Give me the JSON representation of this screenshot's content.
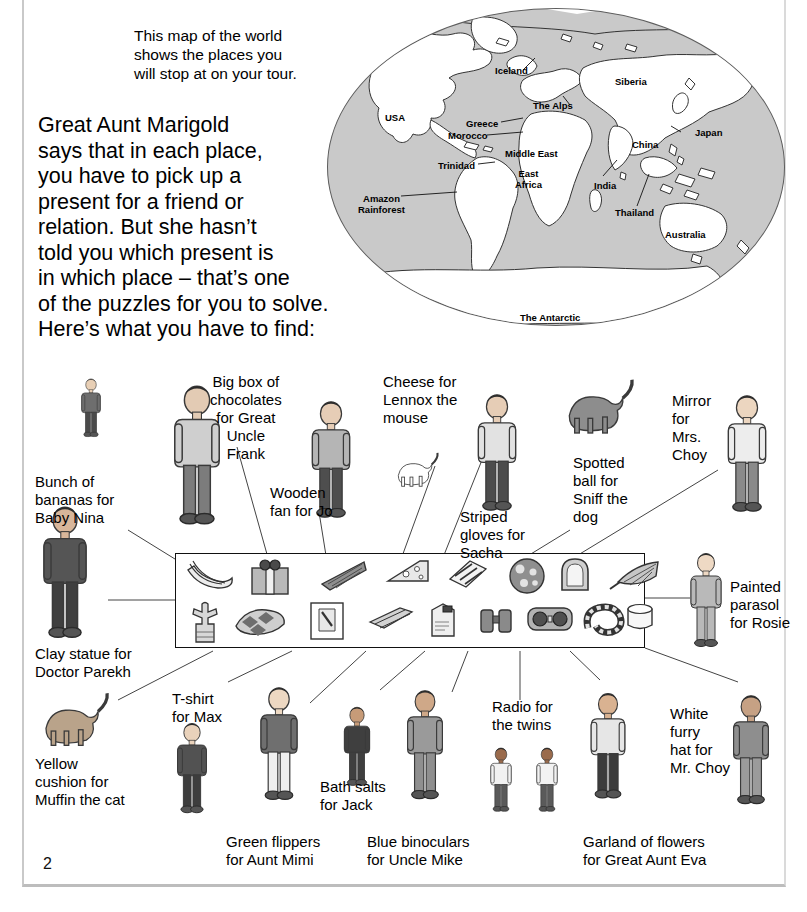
{
  "page": {
    "number": "2",
    "background": "#ffffff",
    "frame_color": "#c9c9c9"
  },
  "intro": {
    "map_caption": "This map of the world\nshows the places you\nwill stop at on your tour.",
    "body": "Great Aunt Marigold\nsays that in each place,\nyou have to pick up a\npresent for a friend or\nrelation. But she hasn’t\ntold you which present is\nin which place – that’s one\nof the puzzles for you to solve.\nHere’s what you have to find:"
  },
  "map": {
    "ocean_color": "#c9c9c9",
    "land_outline": "#333333",
    "labels": [
      {
        "name": "USA",
        "text": "USA",
        "x": 58,
        "y": 104
      },
      {
        "name": "Iceland",
        "text": "Iceland",
        "x": 168,
        "y": 57
      },
      {
        "name": "Siberia",
        "text": "Siberia",
        "x": 288,
        "y": 68
      },
      {
        "name": "The Alps",
        "text": "The Alps",
        "x": 206,
        "y": 92
      },
      {
        "name": "Greece",
        "text": "Greece",
        "x": 139,
        "y": 110
      },
      {
        "name": "Japan",
        "text": "Japan",
        "x": 368,
        "y": 119
      },
      {
        "name": "Morocco",
        "text": "Morocco",
        "x": 121,
        "y": 122
      },
      {
        "name": "China",
        "text": "China",
        "x": 305,
        "y": 131
      },
      {
        "name": "Trinidad",
        "text": "Trinidad",
        "x": 111,
        "y": 152
      },
      {
        "name": "Middle East",
        "text": "Middle East",
        "x": 178,
        "y": 140
      },
      {
        "name": "East Africa",
        "text": "East\nAfrica",
        "x": 188,
        "y": 160
      },
      {
        "name": "India",
        "text": "India",
        "x": 267,
        "y": 172
      },
      {
        "name": "Amazon Rainforest",
        "text": "Amazon\nRainforest",
        "x": 31,
        "y": 185
      },
      {
        "name": "Thailand",
        "text": "Thailand",
        "x": 288,
        "y": 199
      },
      {
        "name": "Australia",
        "text": "Australia",
        "x": 338,
        "y": 221
      },
      {
        "name": "The Antarctic",
        "text": "The Antarctic",
        "x": 193,
        "y": 304
      }
    ]
  },
  "presents": {
    "box_label": "presents-row",
    "items": [
      {
        "name": "bananas",
        "label": "bunch-of-bananas",
        "x": 8,
        "y": 4,
        "row": 1
      },
      {
        "name": "gift-box",
        "label": "big-box-chocolates",
        "x": 72,
        "y": 2,
        "row": 1
      },
      {
        "name": "fan",
        "label": "wooden-fan",
        "x": 140,
        "y": 4,
        "row": 1
      },
      {
        "name": "cheese",
        "label": "cheese",
        "x": 208,
        "y": 3,
        "row": 1
      },
      {
        "name": "gloves",
        "label": "striped-gloves",
        "x": 268,
        "y": 3,
        "row": 1
      },
      {
        "name": "ball",
        "label": "spotted-ball",
        "x": 330,
        "y": 3,
        "row": 1
      },
      {
        "name": "mirror",
        "label": "mirror",
        "x": 382,
        "y": 2,
        "row": 1
      },
      {
        "name": "parasol",
        "label": "painted-parasol",
        "x": 432,
        "y": 4,
        "row": 1
      },
      {
        "name": "statue",
        "label": "clay-statue",
        "x": 12,
        "y": 46,
        "row": 2
      },
      {
        "name": "cushion",
        "label": "yellow-cushion",
        "x": 56,
        "y": 52,
        "row": 2
      },
      {
        "name": "tshirt",
        "label": "t-shirt",
        "x": 132,
        "y": 46,
        "row": 2
      },
      {
        "name": "flippers",
        "label": "green-flippers",
        "x": 190,
        "y": 50,
        "row": 2
      },
      {
        "name": "bathsalts",
        "label": "bath-salts",
        "x": 252,
        "y": 46,
        "row": 2
      },
      {
        "name": "binoculars",
        "label": "blue-binoculars",
        "x": 302,
        "y": 50,
        "row": 2
      },
      {
        "name": "radio",
        "label": "radio",
        "x": 350,
        "y": 50,
        "row": 2
      },
      {
        "name": "garland",
        "label": "garland-of-flowers",
        "x": 406,
        "y": 48,
        "row": 2
      },
      {
        "name": "furry-hat",
        "label": "white-furry-hat",
        "x": 448,
        "y": 48,
        "row": 2
      }
    ]
  },
  "captions": [
    {
      "name": "caption-bananas",
      "text": "Bunch of\nbananas for\nBaby Nina",
      "x": 35,
      "y": 473,
      "align": "left"
    },
    {
      "name": "caption-chocolates",
      "text": "Big box of\nchocolates\nfor Great\nUncle\nFrank",
      "x": 210,
      "y": 373,
      "align": "center"
    },
    {
      "name": "caption-fan",
      "text": "Wooden\nfan for Jo",
      "x": 270,
      "y": 484,
      "align": "left"
    },
    {
      "name": "caption-cheese",
      "text": "Cheese for\nLennox the\nmouse",
      "x": 383,
      "y": 373,
      "align": "left"
    },
    {
      "name": "caption-gloves",
      "text": "Striped\ngloves for\nSacha",
      "x": 460,
      "y": 508,
      "align": "left"
    },
    {
      "name": "caption-ball",
      "text": "Spotted\nball for\nSniff the\ndog",
      "x": 573,
      "y": 454,
      "align": "left"
    },
    {
      "name": "caption-mirror",
      "text": "Mirror\nfor\nMrs.\nChoy",
      "x": 672,
      "y": 392,
      "align": "left"
    },
    {
      "name": "caption-parasol",
      "text": "Painted\nparasol\nfor Rosie",
      "x": 730,
      "y": 578,
      "align": "left"
    },
    {
      "name": "caption-statue",
      "text": "Clay statue for\nDoctor Parekh",
      "x": 35,
      "y": 645,
      "align": "left"
    },
    {
      "name": "caption-cushion",
      "text": "Yellow\ncushion for\nMuffin the cat",
      "x": 35,
      "y": 755,
      "align": "left"
    },
    {
      "name": "caption-tshirt",
      "text": "T-shirt\nfor Max",
      "x": 172,
      "y": 690,
      "align": "left"
    },
    {
      "name": "caption-flippers",
      "text": "Green flippers\nfor Aunt Mimi",
      "x": 226,
      "y": 833,
      "align": "left"
    },
    {
      "name": "caption-bathsalts",
      "text": "Bath salts\nfor Jack",
      "x": 320,
      "y": 778,
      "align": "left"
    },
    {
      "name": "caption-binoculars",
      "text": "Blue binoculars\nfor Uncle Mike",
      "x": 367,
      "y": 833,
      "align": "left"
    },
    {
      "name": "caption-radio",
      "text": "Radio for\nthe twins",
      "x": 492,
      "y": 698,
      "align": "left"
    },
    {
      "name": "caption-garland",
      "text": "Garland of flowers\nfor Great Aunt Eva",
      "x": 583,
      "y": 833,
      "align": "left"
    },
    {
      "name": "caption-furryhat",
      "text": "White\nfurry\nhat for\nMr. Choy",
      "x": 670,
      "y": 705,
      "align": "left"
    }
  ],
  "figures": [
    {
      "name": "figure-baby-nina",
      "x": 62,
      "y": 378,
      "w": 58,
      "h": 62
    },
    {
      "name": "figure-doctor-parekh",
      "x": 28,
      "y": 505,
      "w": 74,
      "h": 140
    },
    {
      "name": "figure-uncle-frank",
      "x": 160,
      "y": 372,
      "w": 74,
      "h": 172
    },
    {
      "name": "figure-jo",
      "x": 300,
      "y": 378,
      "w": 62,
      "h": 168
    },
    {
      "name": "figure-lennox-mouse",
      "x": 390,
      "y": 440,
      "w": 50,
      "h": 60
    },
    {
      "name": "figure-sacha",
      "x": 466,
      "y": 372,
      "w": 62,
      "h": 166
    },
    {
      "name": "figure-sniff-dog",
      "x": 556,
      "y": 376,
      "w": 80,
      "h": 62
    },
    {
      "name": "figure-mrs-choy",
      "x": 716,
      "y": 376,
      "w": 62,
      "h": 160
    },
    {
      "name": "figure-rosie",
      "x": 680,
      "y": 552,
      "w": 52,
      "h": 100
    },
    {
      "name": "figure-muffin-cat",
      "x": 33,
      "y": 690,
      "w": 78,
      "h": 60
    },
    {
      "name": "figure-max",
      "x": 168,
      "y": 714,
      "w": 48,
      "h": 112
    },
    {
      "name": "figure-aunt-mimi",
      "x": 249,
      "y": 666,
      "w": 60,
      "h": 160
    },
    {
      "name": "figure-jack",
      "x": 336,
      "y": 706,
      "w": 42,
      "h": 84
    },
    {
      "name": "figure-uncle-mike",
      "x": 396,
      "y": 664,
      "w": 58,
      "h": 166
    },
    {
      "name": "figure-twin-a",
      "x": 484,
      "y": 736,
      "w": 34,
      "h": 90
    },
    {
      "name": "figure-twin-b",
      "x": 530,
      "y": 736,
      "w": 34,
      "h": 90
    },
    {
      "name": "figure-great-aunt-eva",
      "x": 580,
      "y": 672,
      "w": 56,
      "h": 152
    },
    {
      "name": "figure-mr-choy",
      "x": 722,
      "y": 676,
      "w": 58,
      "h": 152
    }
  ],
  "leaders": [
    {
      "name": "leader-bananas",
      "x1": 128,
      "y1": 530,
      "x2": 196,
      "y2": 572
    },
    {
      "name": "leader-statue",
      "x1": 108,
      "y1": 600,
      "x2": 196,
      "y2": 600
    },
    {
      "name": "leader-chocolates",
      "x1": 237,
      "y1": 447,
      "x2": 270,
      "y2": 565
    },
    {
      "name": "leader-cushion",
      "x1": 118,
      "y1": 700,
      "x2": 213,
      "y2": 651
    },
    {
      "name": "leader-tshirt",
      "x1": 228,
      "y1": 682,
      "x2": 292,
      "y2": 651
    },
    {
      "name": "leader-fan",
      "x1": 319,
      "y1": 512,
      "x2": 328,
      "y2": 568
    },
    {
      "name": "leader-flippers",
      "x1": 310,
      "y1": 703,
      "x2": 366,
      "y2": 651
    },
    {
      "name": "leader-cheese",
      "x1": 435,
      "y1": 466,
      "x2": 400,
      "y2": 562
    },
    {
      "name": "leader-bathsalts",
      "x1": 380,
      "y1": 690,
      "x2": 425,
      "y2": 651
    },
    {
      "name": "leader-gloves",
      "x1": 486,
      "y1": 450,
      "x2": 442,
      "y2": 560
    },
    {
      "name": "leader-binoculars",
      "x1": 452,
      "y1": 692,
      "x2": 468,
      "y2": 651
    },
    {
      "name": "leader-ball",
      "x1": 570,
      "y1": 530,
      "x2": 508,
      "y2": 568
    },
    {
      "name": "leader-radio",
      "x1": 520,
      "y1": 700,
      "x2": 520,
      "y2": 651
    },
    {
      "name": "leader-mirror",
      "x1": 718,
      "y1": 470,
      "x2": 560,
      "y2": 566
    },
    {
      "name": "leader-garland",
      "x1": 600,
      "y1": 680,
      "x2": 570,
      "y2": 651
    },
    {
      "name": "leader-parasol",
      "x1": 690,
      "y1": 598,
      "x2": 628,
      "y2": 598
    },
    {
      "name": "leader-furryhat",
      "x1": 738,
      "y1": 682,
      "x2": 645,
      "y2": 648
    }
  ]
}
